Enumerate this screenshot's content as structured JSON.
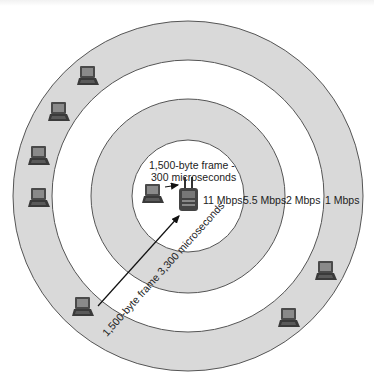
{
  "diagram": {
    "rings": [
      {
        "name": "ring-1mbps",
        "r": 175,
        "fill": "#d9d9d9"
      },
      {
        "name": "ring-2mbps",
        "r": 136,
        "fill": "#ffffff"
      },
      {
        "name": "ring-5-5mbps",
        "r": 97,
        "fill": "#d9d9d9"
      },
      {
        "name": "ring-11mbps",
        "r": 56,
        "fill": "#ffffff"
      }
    ],
    "center": {
      "x": 188,
      "y": 196
    },
    "ring_stroke": "#555555",
    "rate_labels": [
      {
        "text": "11 Mbps",
        "x": 203,
        "y": 204
      },
      {
        "text": "5.5 Mbps",
        "x": 243,
        "y": 204
      },
      {
        "text": "2 Mbps",
        "x": 286,
        "y": 204
      },
      {
        "text": "1 Mbps",
        "x": 325,
        "y": 204
      }
    ],
    "near_frame_label": {
      "line1": "1,500-byte frame -",
      "line2": "300 microseconds"
    },
    "far_frame_label": "1,500-byte frame  3,300 microseconds",
    "access_point": {
      "label": "access-point",
      "x": 180,
      "y": 189
    },
    "laptops": [
      {
        "x": 142,
        "y": 184
      },
      {
        "x": 77,
        "y": 66
      },
      {
        "x": 48,
        "y": 102
      },
      {
        "x": 28,
        "y": 146
      },
      {
        "x": 28,
        "y": 188
      },
      {
        "x": 72,
        "y": 297
      },
      {
        "x": 315,
        "y": 261
      },
      {
        "x": 278,
        "y": 308
      }
    ]
  }
}
